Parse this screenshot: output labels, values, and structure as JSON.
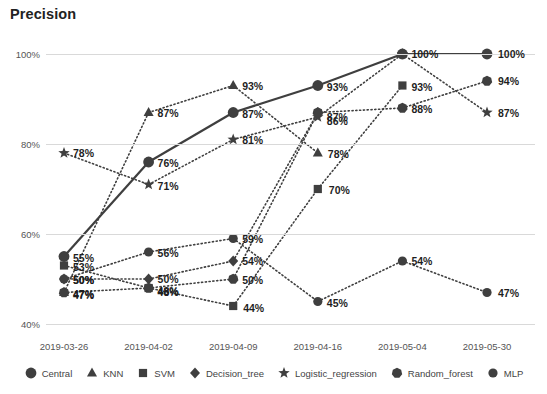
{
  "chart_data": {
    "type": "line",
    "title": "Precision",
    "xlabel": "",
    "ylabel": "",
    "ylim": [
      40,
      104
    ],
    "ytick_labels": [
      "40%",
      "60%",
      "80%",
      "100%"
    ],
    "ytick_values": [
      40,
      60,
      80,
      100
    ],
    "grid": true,
    "legend_position": "bottom",
    "categories": [
      "2019-03-26",
      "2019-04-02",
      "2019-04-09",
      "2019-04-16",
      "2019-05-04",
      "2019-05-30"
    ],
    "series": [
      {
        "name": "Central",
        "marker": "circle",
        "line": "solid",
        "values": [
          55,
          76,
          87,
          93,
          100,
          100
        ],
        "labels": [
          "55%",
          "76%",
          "87%",
          "93%",
          "100%",
          "100%"
        ]
      },
      {
        "name": "KNN",
        "marker": "triangle",
        "line": "dotted",
        "values": [
          47,
          87,
          93,
          78,
          null,
          null
        ],
        "labels": [
          "47%",
          "87%",
          "93%",
          "78%",
          "",
          ""
        ]
      },
      {
        "name": "SVM",
        "marker": "square",
        "line": "dotted",
        "values": [
          53,
          48,
          44,
          70,
          93,
          null
        ],
        "labels": [
          "53%",
          "48%",
          "44%",
          "70%",
          "93%",
          ""
        ]
      },
      {
        "name": "Decision_tree",
        "marker": "diamond",
        "line": "dotted",
        "values": [
          50,
          50,
          54,
          87,
          null,
          null
        ],
        "labels": [
          "50%",
          "50%",
          "54%",
          "87%",
          "",
          ""
        ]
      },
      {
        "name": "Logistic_regression",
        "marker": "star",
        "line": "dotted",
        "values": [
          78,
          71,
          81,
          86,
          100,
          87
        ],
        "labels": [
          "78%",
          "71%",
          "81%",
          "86%",
          "",
          "87%"
        ]
      },
      {
        "name": "Random_forest",
        "marker": "heptagon",
        "line": "dotted",
        "values": [
          47,
          48,
          50,
          87,
          88,
          94
        ],
        "labels": [
          "47%",
          "48%",
          "50%",
          "",
          "88%",
          "94%"
        ]
      },
      {
        "name": "MLP",
        "marker": "circle-small",
        "line": "dotted",
        "values": [
          50,
          56,
          59,
          45,
          54,
          47
        ],
        "labels": [
          "50%",
          "56%",
          "59%",
          "45%",
          "54%",
          "47%"
        ]
      }
    ]
  },
  "colors": {
    "series": "#3f3f3f",
    "grid": "#d9d9d9",
    "text": "#3c3c3c",
    "label": "#1f1f1f"
  },
  "legend": {
    "items": [
      {
        "label": "Central",
        "marker": "circle"
      },
      {
        "label": "KNN",
        "marker": "triangle"
      },
      {
        "label": "SVM",
        "marker": "square"
      },
      {
        "label": "Decision_tree",
        "marker": "diamond"
      },
      {
        "label": "Logistic_regression",
        "marker": "star"
      },
      {
        "label": "Random_forest",
        "marker": "heptagon"
      },
      {
        "label": "MLP",
        "marker": "circle-small"
      }
    ]
  }
}
